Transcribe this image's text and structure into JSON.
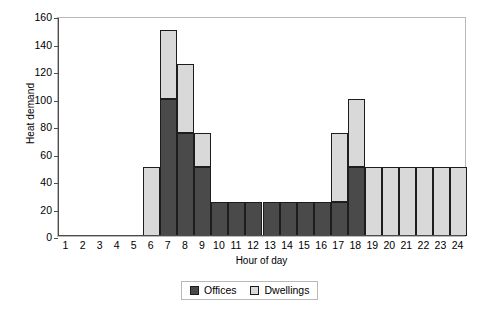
{
  "chart_data": {
    "type": "bar",
    "stacked": true,
    "title": "",
    "xlabel": "Hour of day",
    "ylabel": "Heat demand",
    "categories": [
      "1",
      "2",
      "3",
      "4",
      "5",
      "6",
      "7",
      "8",
      "9",
      "10",
      "11",
      "12",
      "13",
      "14",
      "15",
      "16",
      "17",
      "18",
      "19",
      "20",
      "21",
      "22",
      "23",
      "24"
    ],
    "series": [
      {
        "name": "Offices",
        "color": "#4a4a4a",
        "values": [
          0,
          0,
          0,
          0,
          0,
          0,
          100,
          75,
          50,
          25,
          25,
          25,
          25,
          25,
          25,
          25,
          25,
          50,
          0,
          0,
          0,
          0,
          0,
          0
        ]
      },
      {
        "name": "Dwellings",
        "color": "#d9d9d9",
        "values": [
          0,
          0,
          0,
          0,
          0,
          50,
          50,
          50,
          25,
          0,
          0,
          0,
          0,
          0,
          0,
          0,
          50,
          50,
          50,
          50,
          50,
          50,
          50,
          50
        ]
      }
    ],
    "totals": [
      0,
      0,
      0,
      0,
      0,
      50,
      150,
      125,
      75,
      25,
      25,
      25,
      25,
      25,
      25,
      25,
      75,
      100,
      50,
      50,
      50,
      50,
      50,
      50
    ],
    "ylim": [
      0,
      160
    ],
    "ytick_step": 20,
    "yticks": [
      "0",
      "20",
      "40",
      "60",
      "80",
      "100",
      "120",
      "140",
      "160"
    ],
    "grid": false,
    "legend_position": "bottom-center"
  },
  "legend": {
    "items": [
      {
        "label": "Offices",
        "color": "#4a4a4a"
      },
      {
        "label": "Dwellings",
        "color": "#d9d9d9"
      }
    ]
  }
}
